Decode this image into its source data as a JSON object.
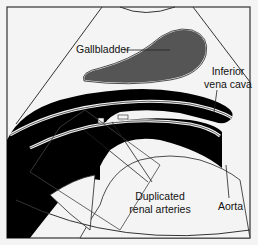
{
  "diagram": {
    "type": "ultrasound-anatomy-illustration",
    "labels": {
      "gallbladder": "Gallbladder",
      "ivc_line1": "Inferior",
      "ivc_line2": "vena cava",
      "renal_line1": "Duplicated",
      "renal_line2": "renal arteries",
      "aorta": "Aorta"
    },
    "colors": {
      "background": "#f4f4f4",
      "frame": "#333333",
      "gallbladder_fill": "#555555",
      "vessel_fill": "#000000",
      "outline": "#222222"
    }
  }
}
